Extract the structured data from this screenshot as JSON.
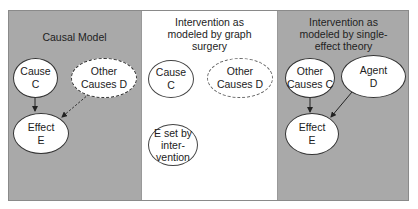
{
  "panels": [
    {
      "title": "Causal Model",
      "background": "#a9a9a9",
      "nodes": [
        {
          "id": "C",
          "label": "Cause\nC",
          "style": "solid"
        },
        {
          "id": "D",
          "label": "Other\nCauses D",
          "style": "dashed"
        },
        {
          "id": "E",
          "label": "Effect\nE",
          "style": "solid"
        }
      ],
      "edges": [
        {
          "from": "C",
          "to": "E",
          "style": "solid"
        },
        {
          "from": "D",
          "to": "E",
          "style": "dashed"
        }
      ]
    },
    {
      "title": "Intervention as\nmodeled by graph\nsurgery",
      "background": "#ffffff",
      "nodes": [
        {
          "id": "C",
          "label": "Cause\nC",
          "style": "solid"
        },
        {
          "id": "D",
          "label": "Other\nCauses D",
          "style": "dashed"
        },
        {
          "id": "E",
          "label": "E set by\ninter-\nvention",
          "style": "solid"
        }
      ],
      "edges": []
    },
    {
      "title": "Intervention as\nmodeled by single-\neffect theory",
      "background": "#a9a9a9",
      "nodes": [
        {
          "id": "C",
          "label": "Other\nCauses C",
          "style": "solid"
        },
        {
          "id": "D",
          "label": "Agent\nD",
          "style": "solid"
        },
        {
          "id": "E",
          "label": "Effect\nE",
          "style": "solid"
        }
      ],
      "edges": [
        {
          "from": "C",
          "to": "E",
          "style": "solid"
        },
        {
          "from": "D",
          "to": "E",
          "style": "solid"
        }
      ]
    }
  ],
  "colors": {
    "gray_panel": "#a9a9a9",
    "white_panel": "#ffffff",
    "node_fill": "#ffffff",
    "stroke": "#333333"
  }
}
